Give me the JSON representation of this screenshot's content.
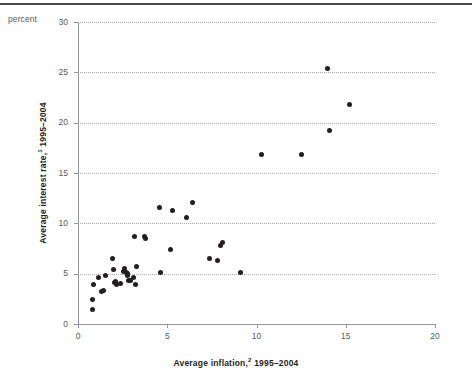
{
  "figure": {
    "unit_label": "percent",
    "x_axis": {
      "title_main": "Average inflation,",
      "title_superscript": "2",
      "title_years": " 1995–2004",
      "tick_labels": [
        "0",
        "5",
        "10",
        "15",
        "20"
      ],
      "ticks": [
        0,
        5,
        10,
        15,
        20
      ],
      "min": 0,
      "max": 20
    },
    "y_axis": {
      "title_main": "Average interest rate,",
      "title_superscript": "1",
      "title_years": " 1995–2004",
      "tick_labels": [
        "0",
        "5",
        "10",
        "15",
        "20",
        "25",
        "30"
      ],
      "ticks": [
        0,
        5,
        10,
        15,
        20,
        25,
        30
      ],
      "min": 0,
      "max": 30
    },
    "colors": {
      "marker": "#231f20",
      "grid": "#a7a9ac",
      "axis": "#939598",
      "rule": "#4d4d4d",
      "tick_text": "#58595b"
    }
  },
  "chart_data": {
    "type": "scatter",
    "title": "",
    "subtitle": "",
    "xlabel": "Average inflation,2 1995–2004",
    "ylabel": "Average interest rate,1 1995–2004",
    "unit": "percent",
    "xlim": [
      0,
      20
    ],
    "ylim": [
      0,
      30
    ],
    "xticks": [
      0,
      5,
      10,
      15,
      20
    ],
    "yticks": [
      0,
      5,
      10,
      15,
      20,
      25,
      30
    ],
    "grid": "horizontal-dotted",
    "legend": "none",
    "marker": "filled-circle",
    "n_points": 40,
    "points": [
      {
        "x": 0.8,
        "y": 1.4
      },
      {
        "x": 0.8,
        "y": 2.4
      },
      {
        "x": 0.85,
        "y": 3.9
      },
      {
        "x": 1.15,
        "y": 4.6
      },
      {
        "x": 1.3,
        "y": 3.2
      },
      {
        "x": 1.45,
        "y": 3.3
      },
      {
        "x": 1.55,
        "y": 4.8
      },
      {
        "x": 1.95,
        "y": 6.5
      },
      {
        "x": 2.0,
        "y": 5.4
      },
      {
        "x": 2.05,
        "y": 4.1
      },
      {
        "x": 2.1,
        "y": 4.2
      },
      {
        "x": 2.15,
        "y": 3.9
      },
      {
        "x": 2.4,
        "y": 4.0
      },
      {
        "x": 2.55,
        "y": 5.2
      },
      {
        "x": 2.6,
        "y": 5.5
      },
      {
        "x": 2.7,
        "y": 5.1
      },
      {
        "x": 2.75,
        "y": 5.0
      },
      {
        "x": 2.8,
        "y": 4.8
      },
      {
        "x": 2.85,
        "y": 4.3
      },
      {
        "x": 2.95,
        "y": 4.3
      },
      {
        "x": 3.1,
        "y": 4.6
      },
      {
        "x": 3.15,
        "y": 8.7
      },
      {
        "x": 3.2,
        "y": 3.9
      },
      {
        "x": 3.3,
        "y": 5.7
      },
      {
        "x": 3.75,
        "y": 8.7
      },
      {
        "x": 3.8,
        "y": 8.5
      },
      {
        "x": 4.55,
        "y": 11.6
      },
      {
        "x": 4.6,
        "y": 5.1
      },
      {
        "x": 5.2,
        "y": 7.4
      },
      {
        "x": 5.3,
        "y": 11.3
      },
      {
        "x": 6.1,
        "y": 10.6
      },
      {
        "x": 6.4,
        "y": 12.1
      },
      {
        "x": 7.35,
        "y": 6.5
      },
      {
        "x": 7.8,
        "y": 6.3
      },
      {
        "x": 8.0,
        "y": 7.8
      },
      {
        "x": 8.1,
        "y": 8.1
      },
      {
        "x": 9.1,
        "y": 5.1
      },
      {
        "x": 10.3,
        "y": 16.8
      },
      {
        "x": 12.5,
        "y": 16.8
      },
      {
        "x": 14.0,
        "y": 25.4
      },
      {
        "x": 14.1,
        "y": 19.2
      },
      {
        "x": 15.2,
        "y": 21.8
      }
    ]
  }
}
